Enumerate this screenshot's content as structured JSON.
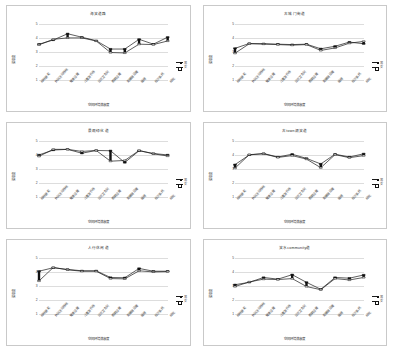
{
  "figure": {
    "layout": "2 columns x 3 rows small multiples",
    "panel_count": 6
  },
  "common": {
    "xlabel": "空间环境满意度",
    "ylabel": "满意度",
    "yticks": [
      "5",
      "4",
      "3",
      "2",
      "1"
    ],
    "ylim": [
      1,
      5
    ],
    "categories": [
      "绿地景观",
      "休闲活动场地",
      "健身设施",
      "儿童游乐场",
      "公共卫生间",
      "照明设施",
      "无障碍设施",
      "座椅",
      "标识系统",
      "绿化"
    ],
    "legend": [
      {
        "label": "男",
        "marker": "filled-square"
      },
      {
        "label": "女",
        "marker": "open-square"
      }
    ]
  },
  "chart_data": [
    {
      "type": "line",
      "title": "海滨道路",
      "xlabel": "空间环境满意度",
      "ylabel": "满意度",
      "ylim": [
        1,
        5
      ],
      "categories": [
        "绿地景观",
        "休闲活动场地",
        "健身设施",
        "儿童游乐场",
        "公共卫生间",
        "照明设施",
        "无障碍设施",
        "座椅",
        "标识系统",
        "绿化"
      ],
      "series": [
        {
          "name": "男",
          "values": [
            3.55,
            3.85,
            4.3,
            4.05,
            3.8,
            3.2,
            3.2,
            3.9,
            3.55,
            4.05
          ]
        },
        {
          "name": "女",
          "values": [
            3.5,
            3.9,
            4.0,
            4.0,
            3.78,
            2.95,
            2.92,
            3.55,
            3.52,
            3.78
          ]
        }
      ]
    },
    {
      "type": "line",
      "title": "古城门街道",
      "xlabel": "空间环境满意度",
      "ylabel": "满意度",
      "ylim": [
        1,
        5
      ],
      "categories": [
        "绿地景观",
        "休闲活动场地",
        "健身设施",
        "儿童游乐场",
        "公共卫生间",
        "照明设施",
        "无障碍设施",
        "座椅",
        "标识系统",
        "绿化"
      ],
      "series": [
        {
          "name": "男",
          "values": [
            3.25,
            3.6,
            3.58,
            3.55,
            3.52,
            3.55,
            3.22,
            3.4,
            3.7,
            3.58
          ]
        },
        {
          "name": "女",
          "values": [
            2.9,
            3.58,
            3.56,
            3.52,
            3.48,
            3.52,
            3.1,
            3.28,
            3.62,
            3.75
          ]
        }
      ]
    },
    {
      "type": "line",
      "title": "景观绿化道",
      "xlabel": "空间环境满意度",
      "ylabel": "满意度",
      "ylim": [
        1,
        5
      ],
      "categories": [
        "绿地景观",
        "休闲活动场地",
        "健身设施",
        "儿童游乐场",
        "公共卫生间",
        "照明设施",
        "无障碍设施",
        "座椅",
        "标识系统",
        "绿化"
      ],
      "series": [
        {
          "name": "男",
          "values": [
            4.0,
            4.35,
            4.4,
            4.12,
            4.32,
            4.3,
            3.45,
            4.3,
            4.1,
            4.0
          ]
        },
        {
          "name": "女",
          "values": [
            3.9,
            4.4,
            4.4,
            4.25,
            4.32,
            3.55,
            3.6,
            4.32,
            4.08,
            3.92
          ]
        }
      ]
    },
    {
      "type": "line",
      "title": "古town湖滨道",
      "xlabel": "空间环境满意度",
      "ylabel": "满意度",
      "ylim": [
        1,
        5
      ],
      "categories": [
        "绿地景观",
        "休闲活动场地",
        "健身设施",
        "儿童游乐场",
        "公共卫生间",
        "照明设施",
        "无障碍设施",
        "座椅",
        "标识系统",
        "绿化"
      ],
      "series": [
        {
          "name": "男",
          "values": [
            3.3,
            4.0,
            4.1,
            3.85,
            4.05,
            3.75,
            3.35,
            4.05,
            3.85,
            4.08
          ]
        },
        {
          "name": "女",
          "values": [
            3.05,
            4.02,
            4.08,
            3.82,
            3.95,
            3.7,
            3.08,
            4.02,
            3.8,
            3.95
          ]
        }
      ]
    },
    {
      "type": "line",
      "title": "人行休闲道",
      "xlabel": "空间环境满意度",
      "ylabel": "满意度",
      "ylim": [
        1,
        5
      ],
      "categories": [
        "绿地景观",
        "休闲活动场地",
        "健身设施",
        "儿童游乐场",
        "公共卫生间",
        "照明设施",
        "无障碍设施",
        "座椅",
        "标识系统",
        "绿化"
      ],
      "series": [
        {
          "name": "男",
          "values": [
            4.05,
            4.3,
            4.18,
            4.08,
            4.08,
            3.6,
            3.58,
            4.25,
            4.05,
            4.05
          ]
        },
        {
          "name": "女",
          "values": [
            3.35,
            4.32,
            4.15,
            4.05,
            4.05,
            3.52,
            3.5,
            4.08,
            4.0,
            4.02
          ]
        }
      ]
    },
    {
      "type": "line",
      "title": "滨水community道",
      "xlabel": "空间环境满意度",
      "ylabel": "满意度",
      "ylim": [
        1,
        5
      ],
      "categories": [
        "绿地景观",
        "休闲活动场地",
        "健身设施",
        "儿童游乐场",
        "公共卫生间",
        "照明设施",
        "无障碍设施",
        "座椅",
        "标识系统",
        "绿化"
      ],
      "series": [
        {
          "name": "男",
          "values": [
            3.08,
            3.25,
            3.6,
            3.48,
            3.8,
            3.25,
            2.75,
            3.6,
            3.55,
            3.78
          ]
        },
        {
          "name": "女",
          "values": [
            2.95,
            3.28,
            3.48,
            3.45,
            3.52,
            2.95,
            2.72,
            3.52,
            3.42,
            3.6
          ]
        }
      ]
    }
  ]
}
